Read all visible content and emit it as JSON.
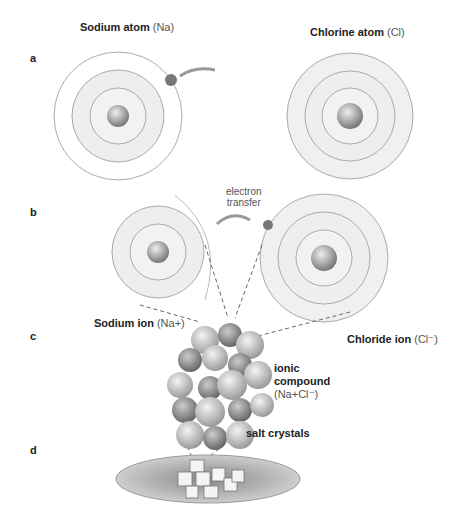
{
  "panels": {
    "a": "a",
    "b": "b",
    "c": "c",
    "d": "d"
  },
  "titles": {
    "sodium_atom": {
      "bold": "Sodium atom",
      "paren": "(Na)"
    },
    "chlorine_atom": {
      "bold": "Chlorine atom",
      "paren": "(Cl)"
    }
  },
  "labels": {
    "electron": "e⁻",
    "electron_transfer_1": "electron",
    "electron_transfer_2": "transfer",
    "sodium_ion": {
      "bold": "Sodium ion",
      "paren": "(Na+)"
    },
    "chloride_ion": {
      "bold": "Chloride ion",
      "paren": "(Cl⁻)"
    },
    "ionic_compound_1": "ionic",
    "ionic_compound_2": "compound",
    "ionic_compound_3": "(Na+Cl⁻)",
    "salt_crystals": "salt crystals"
  },
  "ions": {
    "na": "Na⁺",
    "cl": "Cl⁻"
  }
}
